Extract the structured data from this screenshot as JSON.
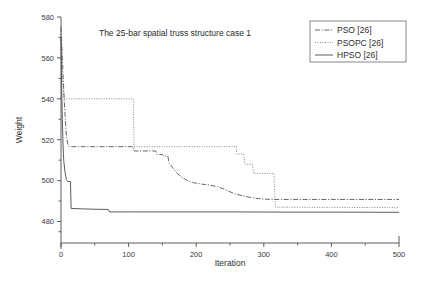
{
  "chart_data": {
    "type": "line",
    "title": "The 25-bar spatial truss structure case 1",
    "xlabel": "Iteration",
    "ylabel": "Weight",
    "xlim": [
      0,
      500
    ],
    "ylim": [
      470,
      580
    ],
    "xticks": [
      0,
      100,
      200,
      300,
      400,
      500
    ],
    "xticklabels": [
      "0",
      "100",
      "200",
      "300",
      "400",
      "500"
    ],
    "xminor_step": 50,
    "yticks": [
      480,
      500,
      520,
      540,
      560,
      580
    ],
    "yticklabels": [
      "480",
      "500",
      "520",
      "540",
      "560",
      "580"
    ],
    "grid": false,
    "legend_position": "top-right",
    "series": [
      {
        "name": "PSO [26]",
        "style": "dashdot",
        "color": "#555555",
        "points": [
          [
            0,
            575
          ],
          [
            1,
            568
          ],
          [
            2,
            560
          ],
          [
            3,
            552
          ],
          [
            4,
            545
          ],
          [
            5,
            538
          ],
          [
            6,
            532
          ],
          [
            7,
            527
          ],
          [
            8,
            522
          ],
          [
            10,
            518
          ],
          [
            12,
            516.6
          ],
          [
            107,
            516.6
          ],
          [
            108,
            514.5
          ],
          [
            140,
            514.5
          ],
          [
            142,
            512.8
          ],
          [
            150,
            512.8
          ],
          [
            152,
            512.0
          ],
          [
            158,
            512.0
          ],
          [
            160,
            508.5
          ],
          [
            166,
            506.0
          ],
          [
            172,
            503.5
          ],
          [
            178,
            501.8
          ],
          [
            186,
            500.2
          ],
          [
            196,
            499.0
          ],
          [
            208,
            498.3
          ],
          [
            220,
            497.8
          ],
          [
            232,
            497.0
          ],
          [
            240,
            496.0
          ],
          [
            248,
            494.8
          ],
          [
            258,
            493.5
          ],
          [
            268,
            492.6
          ],
          [
            280,
            491.8
          ],
          [
            292,
            491.2
          ],
          [
            305,
            490.9
          ],
          [
            318,
            490.8
          ],
          [
            340,
            490.8
          ],
          [
            400,
            490.8
          ],
          [
            500,
            490.8
          ]
        ]
      },
      {
        "name": "PSOPC [26]",
        "style": "dotted",
        "color": "#777777",
        "points": [
          [
            0,
            572
          ],
          [
            1,
            560
          ],
          [
            2,
            552
          ],
          [
            3,
            546
          ],
          [
            4,
            542
          ],
          [
            5,
            540
          ],
          [
            6,
            540
          ],
          [
            107,
            540
          ],
          [
            108,
            516.6
          ],
          [
            130,
            516.6
          ],
          [
            200,
            516.6
          ],
          [
            258,
            516.6
          ],
          [
            259,
            517.0
          ],
          [
            260,
            513.0
          ],
          [
            270,
            513.0
          ],
          [
            272,
            508.0
          ],
          [
            283,
            508.0
          ],
          [
            285,
            503.5
          ],
          [
            300,
            503.5
          ],
          [
            315,
            503.5
          ],
          [
            317,
            487.0
          ],
          [
            340,
            487.0
          ],
          [
            400,
            486.9
          ],
          [
            500,
            486.8
          ]
        ]
      },
      {
        "name": "HPSO [26]",
        "style": "solid",
        "color": "#4a4a4a",
        "points": [
          [
            0,
            570
          ],
          [
            1,
            545
          ],
          [
            2,
            530
          ],
          [
            3,
            518
          ],
          [
            4,
            510
          ],
          [
            6,
            504
          ],
          [
            8,
            500.5
          ],
          [
            10,
            499.6
          ],
          [
            14,
            499.5
          ],
          [
            15,
            486.4
          ],
          [
            30,
            486.2
          ],
          [
            50,
            486.0
          ],
          [
            70,
            485.9
          ],
          [
            72,
            484.7
          ],
          [
            110,
            484.7
          ],
          [
            180,
            484.7
          ],
          [
            260,
            484.7
          ],
          [
            330,
            484.6
          ],
          [
            400,
            484.6
          ],
          [
            500,
            484.5
          ]
        ]
      }
    ]
  },
  "legend": {
    "entries": [
      {
        "label": "PSO [26]"
      },
      {
        "label": "PSOPC [26]"
      },
      {
        "label": "HPSO [26]"
      }
    ]
  },
  "plot_geometry": {
    "left": 61,
    "right": 399,
    "top": 17,
    "bottom": 243,
    "y_top_value": 580,
    "y_bottom_value": 469.5
  }
}
